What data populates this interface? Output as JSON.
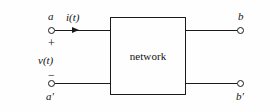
{
  "diagram": {
    "box": {
      "label": "network"
    },
    "terminals": [
      {
        "id": "a",
        "label": "a",
        "position": "top-left"
      },
      {
        "id": "ap",
        "label": "a'",
        "position": "bottom-left"
      },
      {
        "id": "b",
        "label": "b",
        "position": "top-right"
      },
      {
        "id": "bp",
        "label": "b'",
        "position": "bottom-right"
      }
    ],
    "signals": {
      "current_label": "i(t)",
      "voltage_label": "v(t)",
      "polarity_positive": "+",
      "polarity_negative": "−"
    },
    "colors": {
      "ink": "#1a1a1a",
      "background": "#fefefe"
    }
  }
}
